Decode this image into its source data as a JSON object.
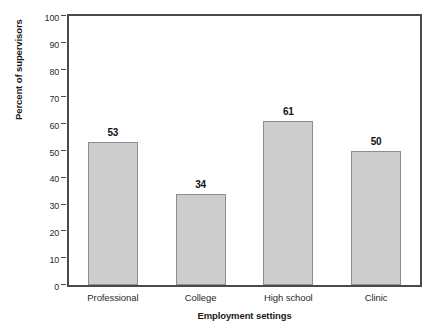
{
  "chart_data": {
    "type": "bar",
    "title": "",
    "categories": [
      "Professional",
      "College",
      "High school",
      "Clinic"
    ],
    "values": [
      53,
      34,
      61,
      50
    ],
    "xlabel": "Employment settings",
    "ylabel": "Percent of supervisors",
    "ylim": [
      0,
      100
    ],
    "yticks": [
      0,
      10,
      20,
      30,
      40,
      50,
      60,
      70,
      80,
      90,
      100
    ],
    "ytick_labels": [
      "0",
      "10",
      "20",
      "30",
      "40",
      "50",
      "60",
      "70",
      "80",
      "90",
      "100"
    ],
    "grid": false,
    "legend": false,
    "value_labels": [
      "53",
      "34",
      "61",
      "50"
    ],
    "colors": {
      "bar_fill": "#cdcdcd",
      "bar_stroke": "#8d8d8d",
      "frame": "#4a4a4a",
      "text": "#1a1a1a",
      "tick_text": "#2b2b2b",
      "background": "#ffffff"
    }
  }
}
